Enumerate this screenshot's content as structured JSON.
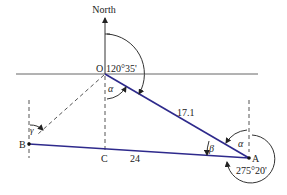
{
  "diagram": {
    "type": "surveying-bearing-diagram",
    "colors": {
      "traverse_line": "#2e2a8c",
      "construction_line": "#555555",
      "text": "#222222"
    },
    "labels": {
      "north": "North",
      "point_o": "O",
      "point_a": "A",
      "point_b": "B",
      "point_c": "C",
      "bearing_oa": "120°35'",
      "bearing_ab": "275°20'",
      "length_oa": "17.1",
      "length_ab": "24",
      "angle_alpha_o": "α",
      "angle_alpha_a": "α",
      "angle_beta": "β",
      "angle_gamma": "γ"
    },
    "points": {
      "O": [
        105,
        74
      ],
      "A": [
        249,
        158
      ],
      "B": [
        29,
        144
      ],
      "C": [
        105,
        150
      ]
    }
  }
}
